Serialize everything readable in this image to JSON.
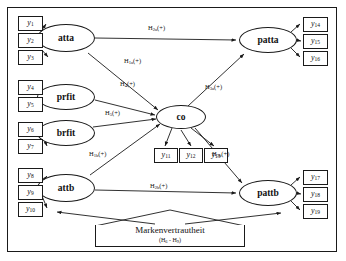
{
  "diagram": {
    "type": "sem-path-diagram",
    "colors": {
      "stroke": "#1a1a1a",
      "background": "#ffffff",
      "text": "#111111"
    },
    "frame": {
      "border_color": "#1a1a1a"
    }
  },
  "latent_variables": [
    {
      "id": "atta",
      "label": "atta",
      "x": 66,
      "y": 38,
      "rw": 58,
      "rh": 28
    },
    {
      "id": "prfit",
      "label": "prfit",
      "x": 66,
      "y": 97,
      "rw": 58,
      "rh": 26
    },
    {
      "id": "brfit",
      "label": "brfit",
      "x": 66,
      "y": 133,
      "rw": 58,
      "rh": 26
    },
    {
      "id": "attb",
      "label": "attb",
      "x": 66,
      "y": 188,
      "rw": 58,
      "rh": 28
    },
    {
      "id": "co",
      "label": "co",
      "x": 181,
      "y": 117,
      "rw": 50,
      "rh": 24
    },
    {
      "id": "patta",
      "label": "patta",
      "x": 268,
      "y": 40,
      "rw": 58,
      "rh": 26
    },
    {
      "id": "pattb",
      "label": "pattb",
      "x": 268,
      "y": 193,
      "rw": 58,
      "rh": 26
    }
  ],
  "indicators": [
    {
      "id": "y1",
      "base": "y",
      "sub": "1",
      "x": 18,
      "y": 16,
      "w": 25,
      "h": 15
    },
    {
      "id": "y2",
      "base": "y",
      "sub": "2",
      "x": 18,
      "y": 33,
      "w": 25,
      "h": 15
    },
    {
      "id": "y3",
      "base": "y",
      "sub": "3",
      "x": 18,
      "y": 50,
      "w": 25,
      "h": 15
    },
    {
      "id": "y4",
      "base": "y",
      "sub": "4",
      "x": 18,
      "y": 80,
      "w": 25,
      "h": 15
    },
    {
      "id": "y5",
      "base": "y",
      "sub": "5",
      "x": 18,
      "y": 97,
      "w": 25,
      "h": 15
    },
    {
      "id": "y6",
      "base": "y",
      "sub": "6",
      "x": 18,
      "y": 122,
      "w": 25,
      "h": 15
    },
    {
      "id": "y7",
      "base": "y",
      "sub": "7",
      "x": 18,
      "y": 139,
      "w": 25,
      "h": 15
    },
    {
      "id": "y8",
      "base": "y",
      "sub": "8",
      "x": 18,
      "y": 168,
      "w": 25,
      "h": 15
    },
    {
      "id": "y9",
      "base": "y",
      "sub": "9",
      "x": 18,
      "y": 185,
      "w": 25,
      "h": 15
    },
    {
      "id": "y10",
      "base": "y",
      "sub": "10",
      "x": 18,
      "y": 202,
      "w": 25,
      "h": 15
    },
    {
      "id": "y11",
      "base": "y",
      "sub": "11",
      "x": 154,
      "y": 148,
      "w": 24,
      "h": 15
    },
    {
      "id": "y12",
      "base": "y",
      "sub": "12",
      "x": 179,
      "y": 148,
      "w": 24,
      "h": 15
    },
    {
      "id": "y13",
      "base": "y",
      "sub": "13",
      "x": 204,
      "y": 148,
      "w": 24,
      "h": 15
    },
    {
      "id": "y14",
      "base": "y",
      "sub": "14",
      "x": 303,
      "y": 17,
      "w": 25,
      "h": 15
    },
    {
      "id": "y15",
      "base": "y",
      "sub": "15",
      "x": 303,
      "y": 34,
      "w": 25,
      "h": 15
    },
    {
      "id": "y16",
      "base": "y",
      "sub": "16",
      "x": 303,
      "y": 51,
      "w": 25,
      "h": 15
    },
    {
      "id": "y17",
      "base": "y",
      "sub": "17",
      "x": 303,
      "y": 170,
      "w": 25,
      "h": 15
    },
    {
      "id": "y18",
      "base": "y",
      "sub": "18",
      "x": 303,
      "y": 187,
      "w": 25,
      "h": 15
    },
    {
      "id": "y19",
      "base": "y",
      "sub": "19",
      "x": 303,
      "y": 204,
      "w": 25,
      "h": 15
    }
  ],
  "path_labels": [
    {
      "id": "h2a",
      "base": "H",
      "sub": "2a",
      "sign": "(+)",
      "x": 148,
      "y": 25,
      "from": "atta",
      "to": "patta"
    },
    {
      "id": "h1a",
      "base": "H",
      "sub": "1a",
      "sign": "(+)",
      "x": 124,
      "y": 58,
      "from": "atta",
      "to": "co"
    },
    {
      "id": "h4",
      "base": "H",
      "sub": "4",
      "sign": "(+)",
      "x": 120,
      "y": 81,
      "from": "prfit",
      "to": "co"
    },
    {
      "id": "h5",
      "base": "H",
      "sub": "5",
      "sign": "(+)",
      "x": 105,
      "y": 110,
      "from": "brfit",
      "to": "co"
    },
    {
      "id": "h1b",
      "base": "H",
      "sub": "1b",
      "sign": "(+)",
      "x": 89,
      "y": 151,
      "from": "attb",
      "to": "co"
    },
    {
      "id": "h2b",
      "base": "H",
      "sub": "2b",
      "sign": "(+)",
      "x": 150,
      "y": 183,
      "from": "attb",
      "to": "pattb"
    },
    {
      "id": "h3a",
      "base": "H",
      "sub": "3a",
      "sign": "(+)",
      "x": 205,
      "y": 84,
      "from": "co",
      "to": "patta"
    },
    {
      "id": "h3b",
      "base": "H",
      "sub": "3b",
      "sign": "(+)",
      "x": 212,
      "y": 151,
      "from": "co",
      "to": "pattb"
    }
  ],
  "moderator": {
    "title": "Markenvertrautheit",
    "hypothesis_range": {
      "prefix": "(",
      "base1": "H",
      "sub1": "6",
      "dash": " - ",
      "base2": "H",
      "sub2": "9",
      "suffix": ")"
    }
  }
}
